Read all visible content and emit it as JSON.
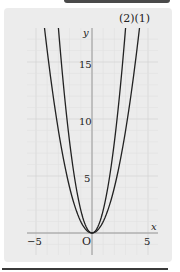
{
  "chart_data": {
    "type": "line",
    "title": "",
    "xlabel": "x",
    "ylabel": "y",
    "xlim": [
      -5.8,
      5.8
    ],
    "ylim": [
      -2,
      19.5
    ],
    "grid": true,
    "x_ticks": [
      -5,
      5
    ],
    "y_ticks": [
      5,
      10,
      15
    ],
    "origin_label": "O",
    "series": [
      {
        "name": "(1)",
        "formula": "y = x^2",
        "coef": 1,
        "points": [
          [
            -4,
            16
          ],
          [
            -3,
            9
          ],
          [
            -2,
            4
          ],
          [
            -1,
            1
          ],
          [
            0,
            0
          ],
          [
            1,
            1
          ],
          [
            2,
            4
          ],
          [
            3,
            9
          ],
          [
            4,
            16
          ]
        ]
      },
      {
        "name": "(2)",
        "formula": "y = 2x^2",
        "coef": 2,
        "points": [
          [
            -3,
            18
          ],
          [
            -2,
            8
          ],
          [
            -1,
            2
          ],
          [
            0,
            0
          ],
          [
            1,
            2
          ],
          [
            2,
            8
          ],
          [
            3,
            18
          ]
        ]
      }
    ],
    "legend": [
      "(2)",
      "(1)"
    ]
  },
  "labels": {
    "curve_labels": "(2)(1)",
    "x_axis": "x",
    "y_axis": "y",
    "origin": "O",
    "tick_neg5": "−5",
    "tick_5": "5",
    "tick_y5": "5",
    "tick_y10": "10",
    "tick_y15": "15"
  }
}
